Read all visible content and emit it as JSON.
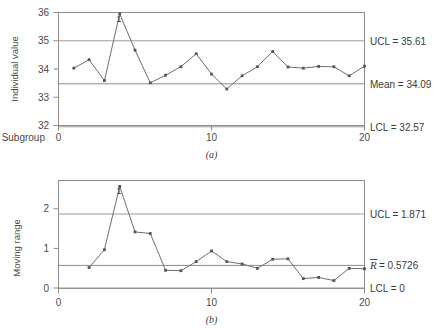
{
  "chart_data": [
    {
      "type": "line",
      "id": "individuals-chart",
      "title": "",
      "caption": "(a)",
      "xlabel": "Subgroup",
      "ylabel": "Individual value",
      "xlim": [
        0,
        20
      ],
      "ylim": [
        32,
        36
      ],
      "xticks": [
        0,
        10,
        20
      ],
      "xtick_labels": [
        "0",
        "10",
        "20"
      ],
      "yticks": [
        32,
        33,
        34,
        35,
        36
      ],
      "ytick_labels": [
        "32",
        "33",
        "34",
        "35",
        "36"
      ],
      "grid": false,
      "x": [
        1,
        2,
        3,
        4,
        5,
        6,
        7,
        8,
        9,
        10,
        11,
        12,
        13,
        14,
        15,
        16,
        17,
        18,
        19,
        20
      ],
      "values": [
        34.03,
        34.33,
        33.59,
        35.95,
        34.67,
        33.51,
        33.78,
        34.08,
        34.54,
        33.82,
        33.29,
        33.76,
        34.08,
        34.62,
        34.07,
        34.03,
        34.09,
        34.08,
        33.76,
        34.1
      ],
      "control_limits": [
        {
          "name": "ucl",
          "label": "UCL = 35.61",
          "value": 35.61
        },
        {
          "name": "center",
          "label": "Mean = 34.09",
          "value": 34.09
        },
        {
          "name": "lcl",
          "label": "LCL = 32.57",
          "value": 32.57
        }
      ],
      "annotations": [
        {
          "name": "violation-1",
          "label": "1",
          "x": 4,
          "y": 35.95
        }
      ]
    },
    {
      "type": "line",
      "id": "moving-range-chart",
      "title": "",
      "caption": "(b)",
      "xlabel": "",
      "ylabel": "Moving range",
      "xlim": [
        0,
        20
      ],
      "ylim": [
        -0.18,
        2.55
      ],
      "xticks": [
        0,
        10,
        20
      ],
      "xtick_labels": [
        "0",
        "10",
        "20"
      ],
      "yticks": [
        0,
        1,
        2
      ],
      "ytick_labels": [
        "0",
        "1",
        "2"
      ],
      "grid": false,
      "x": [
        2,
        3,
        4,
        5,
        6,
        7,
        8,
        9,
        10,
        11,
        12,
        13,
        14,
        15,
        16,
        17,
        18,
        19,
        20
      ],
      "values": [
        0.35,
        0.8,
        2.4,
        1.25,
        1.21,
        0.28,
        0.27,
        0.5,
        0.77,
        0.5,
        0.44,
        0.33,
        0.56,
        0.57,
        0.07,
        0.1,
        0.02,
        0.33,
        0.32
      ],
      "control_limits": [
        {
          "name": "ucl",
          "label": "UCL = 1.871",
          "value": 1.871
        },
        {
          "name": "center",
          "label": "R = 0.5726",
          "label_symbol": "R",
          "label_rest": " = 0.5726",
          "value": 0.5726
        },
        {
          "name": "lcl",
          "label": "LCL = 0",
          "value": 0
        }
      ],
      "annotations": [
        {
          "name": "violation-1",
          "label": "1",
          "x": 4,
          "y": 2.4
        }
      ]
    }
  ]
}
